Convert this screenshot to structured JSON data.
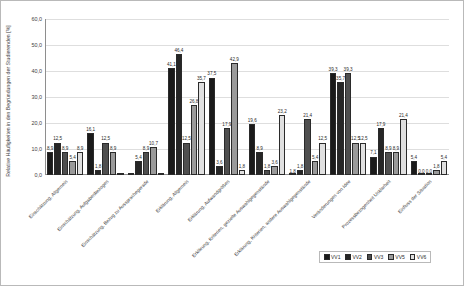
{
  "chart_data": {
    "type": "bar",
    "title": "",
    "xlabel": "",
    "ylabel": "Relative Häufigkeiten in den Begründungen der Studierenden [%]",
    "ylim": [
      0,
      60
    ],
    "yticks": [
      "0,0",
      "10,0",
      "20,0",
      "30,0",
      "40,0",
      "50,0",
      "60,0"
    ],
    "ytick_values": [
      0,
      10,
      20,
      30,
      40,
      50,
      60
    ],
    "grid": true,
    "legend_position": "bottom-right",
    "categories": [
      "Einschätzung, Allgemein",
      "Einschätzung, Aufgabenbezogen",
      "Einschätzung, Bezug zu Aussprachegerade",
      "Erklärung, Allgemein",
      "Erklärung, Aufwandgrößen",
      "Erklärung, Kriterien, gezielte Auswahlgegenstände",
      "Erklärung, Kriterien, andere Auswahlgegenstände",
      "Veränderungen von Idee",
      "Prozessbezogenheit Unklarheit",
      "Einfluss der Situation"
    ],
    "series": [
      {
        "name": "VV1",
        "color": "#1a1a1a",
        "values": [
          8.9,
          16.1,
          0.0,
          41.1,
          37.5,
          19.6,
          0.0,
          39.3,
          7.1,
          5.4
        ],
        "labels": [
          "8,9",
          "16,1",
          "",
          "41,1",
          "37,5",
          "19,6",
          "1,8",
          "39,3",
          "7,1",
          "5,4"
        ]
      },
      {
        "name": "VV2",
        "color": "#262626",
        "values": [
          12.5,
          1.8,
          5.4,
          46.4,
          3.6,
          8.9,
          1.8,
          35.7,
          17.9,
          0.0
        ],
        "labels": [
          "12,5",
          "1,8",
          "5,4",
          "46,4",
          "3,6",
          "8,9",
          "1,8",
          "35,7",
          "17,9",
          "0,0"
        ]
      },
      {
        "name": "VV3",
        "color": "#4f4f4f",
        "values": [
          8.9,
          12.5,
          8.9,
          12.5,
          17.9,
          1.8,
          21.4,
          39.3,
          8.9,
          0.0
        ],
        "labels": [
          "8,9",
          "12,5",
          "8,9",
          "12,5",
          "17,9",
          "1,8",
          "21,4",
          "39,3",
          "8,9",
          "0,0"
        ]
      },
      {
        "name": "VV5",
        "color": "#9a9a9a",
        "values": [
          5.4,
          8.9,
          10.7,
          26.8,
          42.9,
          3.6,
          5.4,
          12.5,
          8.9,
          1.8
        ],
        "labels": [
          "5,4",
          "8,9",
          "10,7",
          "26,8",
          "42,9",
          "3,6",
          "5,4",
          "12,5",
          "8,9",
          "1,8"
        ]
      },
      {
        "name": "VV6",
        "color": "#e0e0e0",
        "values": [
          8.9,
          0.0,
          0.0,
          35.7,
          1.8,
          23.2,
          12.5,
          12.5,
          21.4,
          5.4
        ],
        "labels": [
          "8,9",
          "",
          "",
          "35,7",
          "1,8",
          "23,2",
          "12,5",
          "12,5",
          "21,4",
          "5,4"
        ]
      }
    ]
  }
}
